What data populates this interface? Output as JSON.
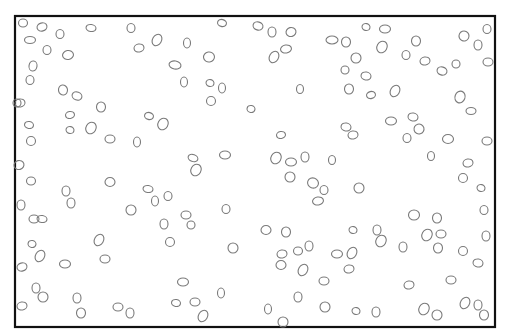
{
  "diagram": {
    "type": "particle-field",
    "canvas": {
      "width": 508,
      "height": 334,
      "background": "#ffffff"
    },
    "frame": {
      "x": 15,
      "y": 16,
      "width": 480,
      "height": 311,
      "stroke": "#111111",
      "stroke_width": 2.2
    },
    "particle_style": {
      "stroke": "#7a7a7a",
      "stroke_width": 1.1
    },
    "particles": [
      [
        23,
        23,
        4.5,
        4,
        0
      ],
      [
        42,
        27,
        5,
        4,
        -15
      ],
      [
        60,
        34,
        4,
        4.5,
        0
      ],
      [
        91,
        28,
        5,
        3.5,
        10
      ],
      [
        131,
        28,
        4,
        4.5,
        0
      ],
      [
        157,
        40,
        4.5,
        6,
        30
      ],
      [
        139,
        48,
        5,
        4,
        -10
      ],
      [
        30,
        40,
        5.5,
        3.5,
        0
      ],
      [
        47,
        50,
        4,
        4.5,
        0
      ],
      [
        68,
        55,
        5.5,
        4.5,
        -10
      ],
      [
        33,
        66,
        4,
        5,
        10
      ],
      [
        30,
        80,
        4,
        4.5,
        0
      ],
      [
        63,
        90,
        4.5,
        5,
        -10
      ],
      [
        77,
        96,
        5,
        4,
        20
      ],
      [
        101,
        107,
        4.5,
        5,
        0
      ],
      [
        20,
        103,
        5,
        4,
        -10
      ],
      [
        222,
        23,
        4.5,
        3.5,
        15
      ],
      [
        258,
        26,
        5,
        4,
        15
      ],
      [
        272,
        32,
        4,
        5,
        0
      ],
      [
        291,
        32,
        5,
        4.5,
        -15
      ],
      [
        187,
        43,
        3.5,
        5,
        0
      ],
      [
        209,
        57,
        5.5,
        5,
        -10
      ],
      [
        274,
        57,
        4.5,
        6,
        30
      ],
      [
        286,
        49,
        5.5,
        4,
        -10
      ],
      [
        332,
        40,
        6,
        4,
        0
      ],
      [
        175,
        65,
        6,
        4,
        10
      ],
      [
        184,
        82,
        3.5,
        5,
        0
      ],
      [
        210,
        83,
        4,
        3.5,
        15
      ],
      [
        222,
        88,
        3.5,
        5,
        0
      ],
      [
        211,
        101,
        4.5,
        4.5,
        0
      ],
      [
        251,
        109,
        4,
        3.5,
        10
      ],
      [
        300,
        89,
        3.5,
        4.5,
        0
      ],
      [
        366,
        27,
        4,
        3.5,
        15
      ],
      [
        385,
        29,
        5.5,
        4,
        0
      ],
      [
        346,
        42,
        4.5,
        5,
        0
      ],
      [
        382,
        47,
        5,
        6,
        30
      ],
      [
        416,
        41,
        4.5,
        5,
        0
      ],
      [
        464,
        36,
        5,
        5,
        -20
      ],
      [
        487,
        29,
        4,
        4.5,
        0
      ],
      [
        478,
        45,
        4,
        5,
        0
      ],
      [
        356,
        58,
        5,
        5,
        0
      ],
      [
        345,
        70,
        4,
        4,
        0
      ],
      [
        366,
        76,
        5,
        4,
        10
      ],
      [
        406,
        55,
        4,
        4.5,
        0
      ],
      [
        425,
        61,
        5,
        4,
        -10
      ],
      [
        442,
        71,
        5,
        4,
        15
      ],
      [
        456,
        64,
        4,
        4,
        0
      ],
      [
        488,
        62,
        5,
        4,
        0
      ],
      [
        349,
        89,
        4.5,
        5,
        0
      ],
      [
        371,
        95,
        4.5,
        3.5,
        -15
      ],
      [
        395,
        91,
        4.5,
        6,
        30
      ],
      [
        460,
        97,
        5,
        6,
        20
      ],
      [
        471,
        111,
        5,
        3.5,
        0
      ],
      [
        29,
        125,
        4.5,
        3.5,
        10
      ],
      [
        31,
        141,
        4.5,
        4.5,
        0
      ],
      [
        70,
        115,
        4.5,
        3.5,
        -10
      ],
      [
        70,
        130,
        4,
        3.5,
        15
      ],
      [
        91,
        128,
        5,
        6,
        30
      ],
      [
        110,
        139,
        5,
        4,
        0
      ],
      [
        137,
        142,
        3.5,
        5,
        0
      ],
      [
        149,
        116,
        4.5,
        3.5,
        15
      ],
      [
        163,
        124,
        5,
        6,
        30
      ],
      [
        193,
        158,
        5,
        3.5,
        20
      ],
      [
        196,
        170,
        5,
        6,
        30
      ],
      [
        225,
        155,
        5.5,
        4,
        0
      ],
      [
        281,
        135,
        4.5,
        3.5,
        -10
      ],
      [
        276,
        158,
        5,
        6,
        30
      ],
      [
        291,
        162,
        5.5,
        4,
        0
      ],
      [
        305,
        157,
        4,
        5,
        0
      ],
      [
        332,
        160,
        3.5,
        4.5,
        0
      ],
      [
        290,
        177,
        5,
        5,
        0
      ],
      [
        313,
        183,
        5.5,
        5,
        20
      ],
      [
        324,
        190,
        4,
        4.5,
        0
      ],
      [
        318,
        201,
        5.5,
        4,
        -10
      ],
      [
        226,
        209,
        4,
        4.5,
        0
      ],
      [
        346,
        127,
        5,
        4,
        10
      ],
      [
        353,
        135,
        5,
        4,
        -10
      ],
      [
        391,
        121,
        5.5,
        4,
        0
      ],
      [
        413,
        117,
        5,
        4,
        10
      ],
      [
        419,
        129,
        5,
        5,
        -15
      ],
      [
        407,
        138,
        4,
        4.5,
        0
      ],
      [
        448,
        139,
        5.5,
        4.5,
        0
      ],
      [
        487,
        141,
        5,
        4,
        0
      ],
      [
        431,
        156,
        3.5,
        4.5,
        0
      ],
      [
        468,
        163,
        5,
        4,
        -10
      ],
      [
        463,
        178,
        4.5,
        4.5,
        0
      ],
      [
        481,
        188,
        4,
        3.5,
        15
      ],
      [
        359,
        188,
        5,
        5,
        0
      ],
      [
        484,
        210,
        4,
        4.5,
        0
      ],
      [
        17,
        103,
        4,
        4,
        0
      ],
      [
        19,
        165,
        5,
        4.5,
        -15
      ],
      [
        31,
        181,
        4.5,
        4,
        0
      ],
      [
        21,
        205,
        4,
        5,
        0
      ],
      [
        66,
        191,
        4,
        5,
        0
      ],
      [
        71,
        203,
        4,
        5,
        0
      ],
      [
        110,
        182,
        5,
        4.5,
        0
      ],
      [
        131,
        210,
        5,
        5,
        0
      ],
      [
        148,
        189,
        5,
        3.5,
        10
      ],
      [
        155,
        201,
        3.5,
        5,
        0
      ],
      [
        168,
        196,
        4,
        4.5,
        0
      ],
      [
        34,
        219,
        5,
        4,
        0
      ],
      [
        42,
        219,
        5,
        3.5,
        10
      ],
      [
        32,
        244,
        4,
        3.5,
        10
      ],
      [
        40,
        256,
        4.5,
        6,
        30
      ],
      [
        22,
        267,
        5,
        4,
        -15
      ],
      [
        65,
        264,
        5.5,
        4,
        0
      ],
      [
        99,
        240,
        4.5,
        6,
        30
      ],
      [
        105,
        259,
        5,
        4,
        0
      ],
      [
        36,
        288,
        4,
        5,
        0
      ],
      [
        43,
        297,
        5,
        5,
        0
      ],
      [
        22,
        306,
        5,
        4,
        -10
      ],
      [
        77,
        298,
        4,
        5,
        0
      ],
      [
        81,
        313,
        4.5,
        5,
        0
      ],
      [
        118,
        307,
        5,
        4,
        0
      ],
      [
        130,
        313,
        4,
        5,
        0
      ],
      [
        186,
        215,
        5,
        4,
        0
      ],
      [
        191,
        225,
        4,
        4,
        0
      ],
      [
        170,
        242,
        4.5,
        4.5,
        0
      ],
      [
        164,
        224,
        4,
        5,
        0
      ],
      [
        233,
        248,
        5,
        5,
        0
      ],
      [
        266,
        230,
        5,
        4.5,
        0
      ],
      [
        286,
        232,
        4.5,
        5,
        0
      ],
      [
        282,
        254,
        5,
        4,
        -10
      ],
      [
        281,
        265,
        5,
        4.5,
        0
      ],
      [
        303,
        270,
        4.5,
        6,
        30
      ],
      [
        298,
        251,
        4.5,
        4,
        0
      ],
      [
        309,
        246,
        4,
        5,
        0
      ],
      [
        183,
        282,
        5.5,
        4,
        0
      ],
      [
        176,
        303,
        4.5,
        3.5,
        10
      ],
      [
        195,
        302,
        5,
        4,
        0
      ],
      [
        203,
        316,
        4.5,
        6,
        30
      ],
      [
        221,
        293,
        3.5,
        5,
        0
      ],
      [
        268,
        309,
        3.5,
        5,
        0
      ],
      [
        283,
        322,
        5,
        5,
        0
      ],
      [
        353,
        230,
        4,
        3.5,
        15
      ],
      [
        381,
        241,
        5,
        6,
        30
      ],
      [
        377,
        230,
        4,
        5,
        0
      ],
      [
        403,
        247,
        4,
        5,
        0
      ],
      [
        437,
        218,
        4.5,
        5,
        0
      ],
      [
        427,
        235,
        5,
        6,
        30
      ],
      [
        441,
        234,
        5,
        4,
        0
      ],
      [
        438,
        248,
        4.5,
        5,
        0
      ],
      [
        463,
        251,
        4.5,
        4.5,
        0
      ],
      [
        478,
        263,
        5,
        4,
        10
      ],
      [
        486,
        236,
        4,
        5,
        0
      ],
      [
        414,
        215,
        5.5,
        5,
        0
      ],
      [
        337,
        254,
        5.5,
        4,
        0
      ],
      [
        352,
        253,
        4.5,
        6,
        30
      ],
      [
        349,
        269,
        5,
        4,
        -10
      ],
      [
        324,
        281,
        5,
        4,
        0
      ],
      [
        298,
        297,
        4,
        5,
        0
      ],
      [
        325,
        307,
        5,
        5,
        0
      ],
      [
        356,
        311,
        4,
        3.5,
        15
      ],
      [
        376,
        312,
        4,
        5,
        0
      ],
      [
        409,
        285,
        5,
        4,
        -10
      ],
      [
        424,
        309,
        5,
        6,
        30
      ],
      [
        437,
        315,
        5,
        5,
        0
      ],
      [
        451,
        280,
        5,
        4,
        0
      ],
      [
        465,
        303,
        4.5,
        6,
        30
      ],
      [
        484,
        315,
        4.5,
        5,
        0
      ],
      [
        478,
        305,
        4,
        5,
        0
      ]
    ]
  }
}
